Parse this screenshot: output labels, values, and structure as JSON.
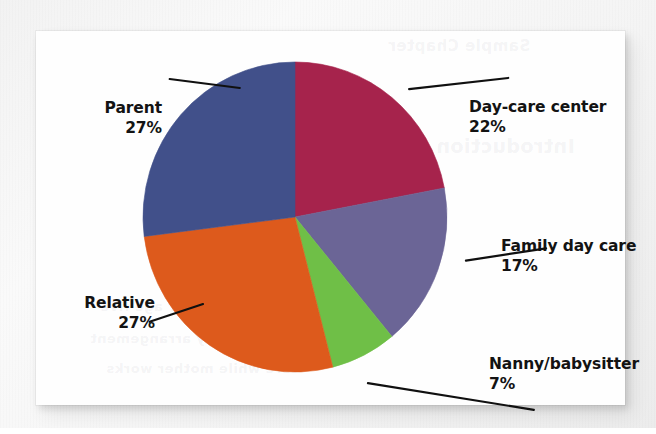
{
  "document": {
    "type": "scanned-page-figure",
    "card_background": "#fefefe",
    "page_background": "#f2f2f2"
  },
  "bleed_text": {
    "top": "Sample Chapter",
    "mid": "Introduction",
    "low1": "children under age five",
    "low2": "primary arrangement",
    "low3": "care while mother works"
  },
  "chart_data": {
    "type": "pie",
    "title": "",
    "xlabel": "",
    "ylabel": "",
    "legend_position": "callout-labels",
    "grid": false,
    "start_angle_deg": 0,
    "direction": "clockwise",
    "units": "percent",
    "categories": [
      "Day-care center",
      "Family day care",
      "Nanny/babysitter",
      "Relative",
      "Parent"
    ],
    "values": [
      22,
      17,
      7,
      27,
      27
    ],
    "value_labels": [
      "22%",
      "17%",
      "7%",
      "27%",
      "27%"
    ],
    "colors": [
      "#a6234c",
      "#6b6596",
      "#6fbf47",
      "#dd5a1c",
      "#41508a"
    ],
    "total": 100,
    "slices": [
      {
        "label": "Day-care center",
        "value": 22,
        "value_label": "22%",
        "color": "#a6234c",
        "label_side": "right"
      },
      {
        "label": "Family day care",
        "value": 17,
        "value_label": "17%",
        "color": "#6b6596",
        "label_side": "right"
      },
      {
        "label": "Nanny/babysitter",
        "value": 7,
        "value_label": "7%",
        "color": "#6fbf47",
        "label_side": "right"
      },
      {
        "label": "Relative",
        "value": 27,
        "value_label": "27%",
        "color": "#dd5a1c",
        "label_side": "left"
      },
      {
        "label": "Parent",
        "value": 27,
        "value_label": "27%",
        "color": "#41508a",
        "label_side": "left"
      }
    ]
  },
  "geometry": {
    "center_x": 259,
    "center_y": 186,
    "radius_x": 152,
    "radius_y": 155
  }
}
